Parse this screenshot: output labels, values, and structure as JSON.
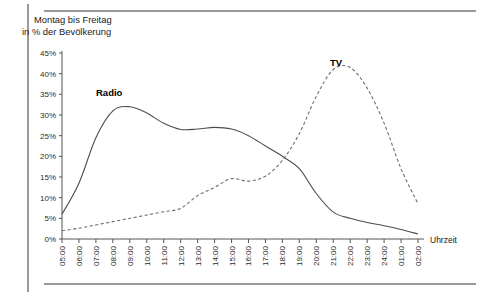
{
  "figure": {
    "title_line1": "Montag bis Freitag",
    "title_line2": "in % der Bevölkerung",
    "xaxis_name": "Uhrzeit",
    "label_radio": "Radio",
    "label_tv": "TV"
  },
  "chart_data": {
    "type": "line",
    "title": "Montag bis Freitag in % der Bevölkerung",
    "xlabel": "Uhrzeit",
    "ylabel": "in % der Bevölkerung",
    "ylim": [
      0,
      45
    ],
    "ytick_labels": [
      "0%",
      "5%",
      "10%",
      "15%",
      "20%",
      "25%",
      "30%",
      "35%",
      "40%",
      "45%"
    ],
    "ytick_values": [
      0,
      5,
      10,
      15,
      20,
      25,
      30,
      35,
      40,
      45
    ],
    "grid": false,
    "legend": "inline-annotation",
    "categories": [
      "05:00",
      "06:00",
      "07:00",
      "08:00",
      "09:00",
      "10:00",
      "11:00",
      "12:00",
      "13:00",
      "14:00",
      "15:00",
      "16:00",
      "17:00",
      "18:00",
      "19:00",
      "20:00",
      "21:00",
      "22:00",
      "23:00",
      "24:00",
      "01:00",
      "02:00"
    ],
    "series": [
      {
        "name": "Radio",
        "style": "solid",
        "color": "#4d4d4d",
        "values": [
          6.0,
          13.5,
          24.5,
          31.0,
          32.0,
          30.5,
          28.0,
          26.5,
          26.6,
          27.0,
          26.6,
          25.0,
          22.5,
          20.0,
          17.0,
          11.0,
          6.5,
          5.0,
          4.0,
          3.2,
          2.3,
          1.2
        ]
      },
      {
        "name": "TV",
        "style": "dashed",
        "color": "#6e6e6e",
        "values": [
          2.0,
          2.6,
          3.4,
          4.2,
          5.0,
          5.8,
          6.6,
          7.4,
          10.5,
          12.5,
          14.6,
          14.0,
          15.2,
          19.0,
          25.5,
          34.5,
          41.0,
          41.5,
          36.5,
          28.0,
          17.0,
          8.5
        ]
      }
    ]
  }
}
